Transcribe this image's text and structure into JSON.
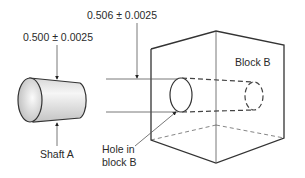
{
  "diagram": {
    "labels": {
      "shaft_dimension": "0.500 ± 0.0025",
      "hole_dimension": "0.506 ± 0.0025",
      "block": "Block B",
      "shaft": "Shaft A",
      "hole_line1": "Hole in",
      "hole_line2": "block B"
    },
    "colors": {
      "line": "#333333",
      "shaft_fill_light": "#f4f4f4",
      "shaft_fill_dark": "#bdbdbd"
    }
  }
}
